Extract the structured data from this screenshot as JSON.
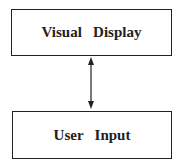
{
  "diagram": {
    "nodes": [
      {
        "id": "visual-display",
        "label": "Visual   Display"
      },
      {
        "id": "user-input",
        "label": "User   Input"
      }
    ],
    "edges": [
      {
        "from": "visual-display",
        "to": "user-input",
        "direction": "bidirectional"
      }
    ]
  }
}
